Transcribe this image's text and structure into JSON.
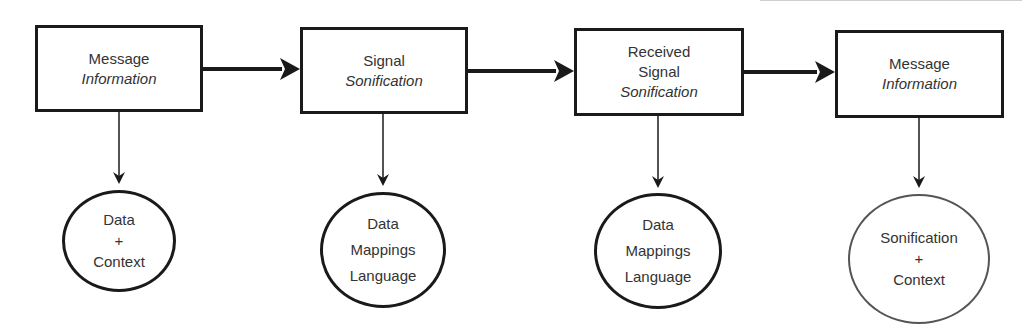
{
  "diagram": {
    "stages": [
      {
        "id": "stage1",
        "line1": "Message",
        "line2": "",
        "italic": "Information",
        "detail": [
          "Data",
          "+",
          "Context"
        ]
      },
      {
        "id": "stage2",
        "line1": "Signal",
        "line2": "",
        "italic": "Sonification",
        "detail": [
          "Data",
          "Mappings",
          "Language"
        ]
      },
      {
        "id": "stage3",
        "line1": "Received",
        "line2": "Signal",
        "italic": "Sonification",
        "detail": [
          "Data",
          "Mappings",
          "Language"
        ]
      },
      {
        "id": "stage4",
        "line1": "Message",
        "line2": "",
        "italic": "Information",
        "detail": [
          "Sonification",
          "+",
          "Context"
        ]
      }
    ],
    "colors": {
      "stroke": "#1a1a1a",
      "text": "#333333",
      "background": "#ffffff"
    }
  }
}
